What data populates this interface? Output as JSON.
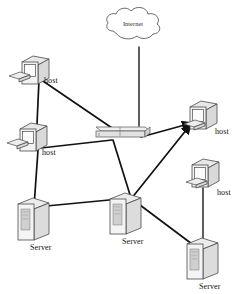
{
  "diagram": {
    "type": "network-topology",
    "background_color": "#ffffff",
    "line_color": "#111111",
    "device_fill_color": "#f2f2f2",
    "device_stroke_color": "#4a4a4a"
  },
  "nodes": [
    {
      "id": "internet",
      "label": "Internet",
      "kind": "cloud",
      "x": 130,
      "y": 28
    },
    {
      "id": "host1",
      "label": "host",
      "kind": "desktop-computer",
      "x": 30,
      "y": 68,
      "label_x": 47,
      "label_y": 82
    },
    {
      "id": "host2",
      "label": "host",
      "kind": "desktop-computer",
      "x": 28,
      "y": 134,
      "label_x": 45,
      "label_y": 153
    },
    {
      "id": "host3",
      "label": "host",
      "kind": "desktop-computer",
      "x": 196,
      "y": 114,
      "label_x": 214,
      "label_y": 132
    },
    {
      "id": "host4",
      "label": "host",
      "kind": "desktop-computer",
      "x": 198,
      "y": 175,
      "label_x": 216,
      "label_y": 193
    },
    {
      "id": "router",
      "label": "",
      "kind": "router",
      "x": 117,
      "y": 130
    },
    {
      "id": "server1",
      "label": "Server",
      "kind": "tower-server",
      "x": 30,
      "y": 215,
      "label_x": 46,
      "label_y": 245
    },
    {
      "id": "server2",
      "label": "Server",
      "kind": "tower-server",
      "x": 117,
      "y": 210,
      "label_x": 133,
      "label_y": 239
    },
    {
      "id": "server3",
      "label": "Server",
      "kind": "tower-server",
      "x": 195,
      "y": 252,
      "label_x": 211,
      "label_y": 283
    }
  ],
  "links": [
    {
      "from": "internet",
      "to": "router"
    },
    {
      "from": "host1",
      "to": "host2"
    },
    {
      "from": "host1",
      "to": "router"
    },
    {
      "from": "host2",
      "to": "router"
    },
    {
      "from": "host2",
      "to": "server1"
    },
    {
      "from": "server1",
      "to": "server2"
    },
    {
      "from": "router",
      "to": "server2"
    },
    {
      "from": "router",
      "to": "host3"
    },
    {
      "from": "server2",
      "to": "host3"
    },
    {
      "from": "server2",
      "to": "server3"
    },
    {
      "from": "host4",
      "to": "server3"
    }
  ],
  "labels": {
    "internet": "Internet",
    "host1": "host",
    "host2": "host",
    "host3": "host",
    "host4": "host",
    "server1": "Server",
    "server2": "Server",
    "server3": "Server"
  }
}
